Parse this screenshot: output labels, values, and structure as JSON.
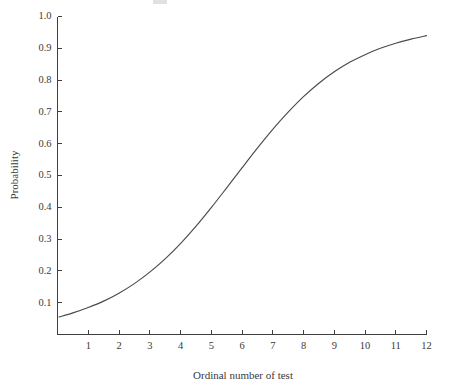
{
  "chart_data": {
    "type": "line",
    "title": "",
    "xlabel": "Ordinal number of test",
    "ylabel": "Probability",
    "xlim": [
      0,
      12
    ],
    "ylim": [
      0,
      1.0
    ],
    "grid": false,
    "legend": "none",
    "xticks": [
      "1",
      "2",
      "3",
      "4",
      "5",
      "6",
      "7",
      "8",
      "9",
      "10",
      "11",
      "12"
    ],
    "xtick_values": [
      1,
      2,
      3,
      4,
      5,
      6,
      7,
      8,
      9,
      10,
      11,
      12
    ],
    "yticks": [
      "0.1",
      "0.2",
      "0.3",
      "0.4",
      "0.5",
      "0.6",
      "0.7",
      "0.8",
      "0.9",
      "1.0"
    ],
    "ytick_values": [
      0.1,
      0.2,
      0.3,
      0.4,
      0.5,
      0.6,
      0.7,
      0.8,
      0.9,
      1.0
    ],
    "series": [
      {
        "name": "Probability of detection",
        "color": "#4a4a4a",
        "x": [
          0.05,
          0.5,
          1.0,
          1.5,
          2.0,
          2.5,
          3.0,
          3.5,
          4.0,
          4.5,
          5.0,
          5.5,
          6.0,
          6.5,
          7.0,
          7.5,
          8.0,
          8.5,
          9.0,
          9.5,
          10.0,
          10.5,
          11.0,
          11.5,
          12.0
        ],
        "values": [
          0.055,
          0.068,
          0.085,
          0.105,
          0.13,
          0.16,
          0.196,
          0.238,
          0.286,
          0.34,
          0.399,
          0.461,
          0.524,
          0.586,
          0.645,
          0.699,
          0.748,
          0.79,
          0.826,
          0.856,
          0.88,
          0.9,
          0.916,
          0.929,
          0.94
        ]
      }
    ]
  },
  "axes": {
    "y_title": "Probability",
    "x_title": "Ordinal number of test"
  }
}
